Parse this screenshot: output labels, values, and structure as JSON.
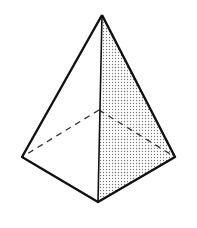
{
  "diagram": {
    "type": "tetrahedron",
    "vertices": {
      "apex": [
        102,
        15
      ],
      "left": [
        22,
        157
      ],
      "right": [
        175,
        157
      ],
      "front": [
        98,
        202
      ],
      "hidden": [
        99,
        110
      ]
    },
    "colors": {
      "stroke": "#111111",
      "shade_dot": "#777777",
      "background": "#ffffff"
    }
  }
}
